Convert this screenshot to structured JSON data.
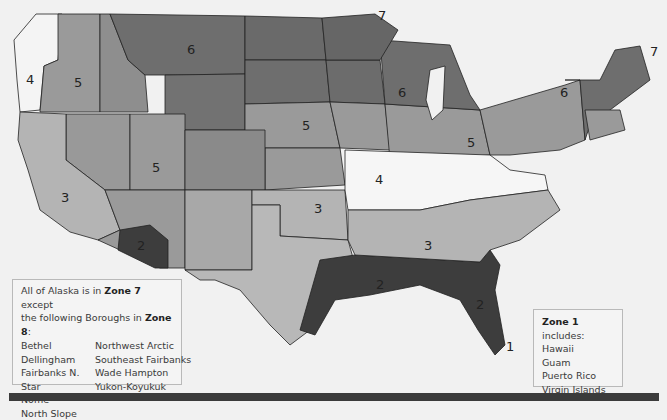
{
  "map": {
    "title": "USDA Plant Hardiness Zone Map (contiguous United States)",
    "zone_colors": {
      "1": "#7a7a7a",
      "2": "#3d3d3d",
      "3": "#b4b4b4",
      "4": "#f6f6f6",
      "5": "#9a9a9a",
      "6": "#6f6f6f",
      "7": "#666666"
    },
    "zone_labels": [
      {
        "zone": "7",
        "x": 378,
        "y": 20
      },
      {
        "zone": "7",
        "x": 650,
        "y": 56
      },
      {
        "zone": "6",
        "x": 192,
        "y": 54
      },
      {
        "zone": "6",
        "x": 403,
        "y": 97
      },
      {
        "zone": "6",
        "x": 565,
        "y": 97
      },
      {
        "zone": "5",
        "x": 79,
        "y": 87
      },
      {
        "zone": "5",
        "x": 307,
        "y": 130
      },
      {
        "zone": "5",
        "x": 472,
        "y": 147
      },
      {
        "zone": "5",
        "x": 157,
        "y": 172
      },
      {
        "zone": "4",
        "x": 31,
        "y": 84
      },
      {
        "zone": "4",
        "x": 380,
        "y": 184
      },
      {
        "zone": "3",
        "x": 66,
        "y": 202
      },
      {
        "zone": "3",
        "x": 319,
        "y": 213
      },
      {
        "zone": "3",
        "x": 429,
        "y": 250
      },
      {
        "zone": "2",
        "x": 142,
        "y": 250
      },
      {
        "zone": "2",
        "x": 381,
        "y": 289
      },
      {
        "zone": "2",
        "x": 481,
        "y": 309
      },
      {
        "zone": "1",
        "x": 511,
        "y": 351
      }
    ]
  },
  "alaska_box": {
    "line1_pre": "All of Alaska is in ",
    "line1_zone": "Zone 7",
    "line1_post": " except",
    "line2_pre": "the following Boroughs in ",
    "line2_zone": "Zone 8",
    "line2_post": ":",
    "boroughs_col1": [
      "Bethel",
      "Dellingham",
      "Fairbanks N. Star",
      "Nome",
      "North Slope"
    ],
    "boroughs_col2": [
      "Northwest Arctic",
      "Southeast Fairbanks",
      "Wade Hampton",
      "Yukon-Koyukuk"
    ]
  },
  "zone1_box": {
    "title_zone": "Zone 1",
    "title_post": " includes:",
    "items": [
      "Hawaii",
      "Guam",
      "Puerto Rico",
      "Virgin Islands"
    ]
  }
}
